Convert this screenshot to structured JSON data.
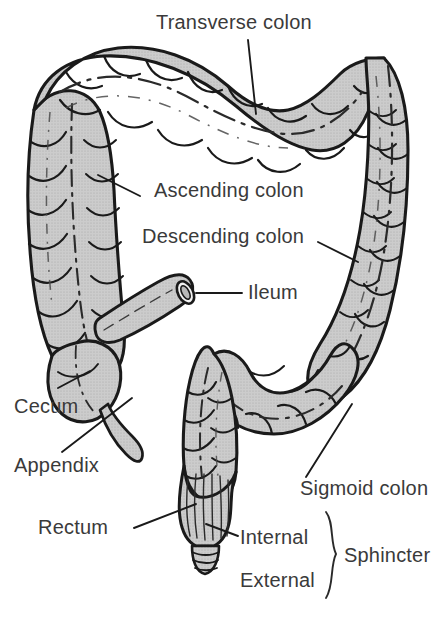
{
  "figure": {
    "background_color": "#ffffff",
    "organ_fill_color": "#c9c9c9",
    "organ_outline_color": "#1a1a1a",
    "label_text_color": "#3a3a3a",
    "leader_line_color": "#1a1a1a"
  },
  "labels": {
    "transverse_colon": "Transverse colon",
    "ascending_colon": "Ascending colon",
    "descending_colon": "Descending colon",
    "ileum": "Ileum",
    "cecum": "Cecum",
    "appendix": "Appendix",
    "sigmoid_colon": "Sigmoid colon",
    "rectum": "Rectum",
    "internal": "Internal",
    "external": "External",
    "sphincter": "Sphincter"
  }
}
